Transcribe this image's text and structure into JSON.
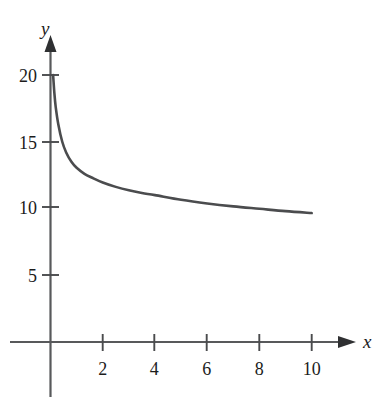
{
  "chart_data": {
    "type": "line",
    "title": "",
    "subtitle": "",
    "xlabel": "x",
    "ylabel": "y",
    "xlim": [
      0,
      11.5
    ],
    "ylim": [
      0,
      21.5
    ],
    "grid": false,
    "legend": null,
    "x_ticks": [
      2,
      4,
      6,
      8,
      10
    ],
    "x_tick_labels": [
      "2",
      "4",
      "6",
      "8",
      "10"
    ],
    "y_ticks": [
      5,
      10,
      15,
      20
    ],
    "y_tick_labels": [
      "5",
      "10",
      "15",
      "20"
    ],
    "axis_arrows": {
      "x": "right",
      "y": "up"
    },
    "series": [
      {
        "name": "curve",
        "color": "#4b4c4e",
        "x": [
          0.1,
          0.15,
          0.2,
          0.3,
          0.45,
          0.6,
          0.8,
          1.0,
          1.3,
          1.6,
          2.0,
          2.5,
          3.0,
          3.5,
          4.0,
          5.0,
          6.0,
          7.0,
          8.0,
          9.0,
          10.0
        ],
        "y": [
          20.0,
          18.6,
          17.6,
          16.3,
          15.0,
          14.2,
          13.5,
          13.05,
          12.6,
          12.3,
          11.95,
          11.62,
          11.36,
          11.16,
          11.0,
          10.65,
          10.38,
          10.16,
          9.98,
          9.8,
          9.66
        ]
      }
    ]
  },
  "axis_labels": {
    "x": "x",
    "y": "y"
  },
  "ticks": {
    "x": [
      "2",
      "4",
      "6",
      "8",
      "10"
    ],
    "y": [
      "20",
      "15",
      "10",
      "5"
    ]
  },
  "colors": {
    "curve": "#4b4c4e",
    "axis": "#58595b",
    "text": "#1c1c1c",
    "background": "#ffffff"
  }
}
